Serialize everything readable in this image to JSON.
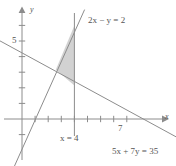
{
  "figure": {
    "kind": "coordinate-plane-graph"
  },
  "axes": {
    "x_label": "x",
    "y_label": "y",
    "x_ticks_labeled": [
      {
        "value": 7,
        "label": "7"
      }
    ],
    "y_ticks_labeled": [
      {
        "value": 5,
        "label": "5"
      }
    ],
    "x_tick_values": [
      1,
      2,
      3,
      4,
      5,
      6,
      7,
      8
    ],
    "y_tick_values": [
      -1,
      1,
      2,
      3,
      4,
      5,
      6
    ],
    "x_range": [
      -1.7,
      11.5
    ],
    "y_range": [
      -3.2,
      7.2
    ],
    "origin_px": [
      22,
      119
    ],
    "unit_x_px": 13.1,
    "unit_y_px": 15.6
  },
  "lines": [
    {
      "id": "line-2x-minus-y",
      "label": "2x − y = 2",
      "equation": "2x - y = 2",
      "slope": 2,
      "intercept": -2,
      "color": "#8c8c8c"
    },
    {
      "id": "line-5x-plus-7y",
      "label": "5x + 7y = 35",
      "equation": "5x + 7y = 35",
      "slope": -0.714285714,
      "intercept": 5,
      "color": "#8c8c8c"
    },
    {
      "id": "line-x-equals-4",
      "label": "x = 4",
      "equation": "x = 4",
      "vertical_at": 4,
      "color": "#8c8c8c"
    }
  ],
  "shaded_region": {
    "name": "feasible-region",
    "fill": "#d2d2d2",
    "vertices": [
      {
        "x": 4,
        "y": 6
      },
      {
        "x": 2.5789,
        "y": 3.1579
      },
      {
        "x": 4,
        "y": 2.1429
      }
    ],
    "vertex_labels": [
      "(4, 6)",
      "(49/19, 60/19)",
      "(4, 15/7)"
    ]
  },
  "colors": {
    "line": "#8c8c8c",
    "axis": "#8c8c8c",
    "fill": "#d2d2d2",
    "text": "#555555",
    "background": "#ffffff"
  }
}
